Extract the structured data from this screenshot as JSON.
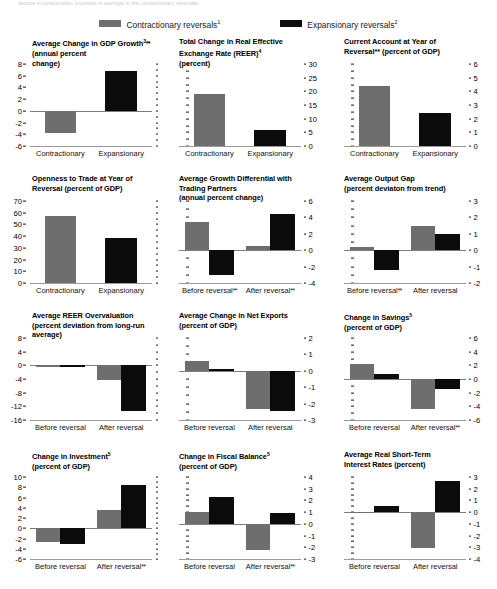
{
  "topnote": "decline in consumption (increase in savings) in the contractionary reversals.",
  "legend": {
    "items": [
      {
        "label": "Contractionary reversals",
        "sup": "1",
        "color": "#6e6e6e",
        "name": "contractionary"
      },
      {
        "label": "Expansionary reversals",
        "sup": "2",
        "color": "#0b0b0b",
        "name": "expansionary"
      }
    ]
  },
  "colors": {
    "gray": "#6e6e6e",
    "black": "#0b0b0b",
    "axis": "#9a9a9a"
  },
  "chart_data": [
    {
      "id": "gdp-growth",
      "type": "bar",
      "title": "Average Change in GDP Growth3** (annual percent change)",
      "title_lines": [
        "Average Change in GDP Growth",
        "(annual percent",
        "change)"
      ],
      "title_sup": "3",
      "title_ast": "**",
      "categories": [
        "Contractionary",
        "Expansionary"
      ],
      "values": [
        -3.8,
        6.8
      ],
      "ylim": [
        -6,
        8
      ],
      "yticks": [
        8,
        6,
        4,
        2,
        0,
        -2,
        -4,
        -6
      ],
      "ylabel_side": "left",
      "ylabel": "",
      "xlabel": "",
      "grid": false,
      "legend_position": "top",
      "mode": "pair"
    },
    {
      "id": "reer-total-change",
      "type": "bar",
      "title": "Total Change in Real Effective Exchange Rate (REER)4 (percent)",
      "title_lines": [
        "Total Change in Real Effective",
        "Exchange Rate (REER)",
        "(percent)"
      ],
      "title_sup": "4",
      "title_ast": "",
      "categories": [
        "Contractionary",
        "Expansionary"
      ],
      "values": [
        19.0,
        5.7
      ],
      "ylim": [
        0,
        30
      ],
      "yticks": [
        30,
        25,
        20,
        15,
        10,
        5,
        0
      ],
      "ylabel_side": "right",
      "ylabel": "",
      "xlabel": "",
      "grid": false,
      "legend_position": "top",
      "mode": "pair"
    },
    {
      "id": "current-account",
      "type": "bar",
      "title": "Current Account at Year of Reversal** (percent of GDP)",
      "title_lines": [
        "Current Account at Year of",
        "Reversal** (percent of GDP)"
      ],
      "title_sup": "",
      "title_ast": "",
      "categories": [
        "Contractionary",
        "Expansionary"
      ],
      "values": [
        4.4,
        2.4
      ],
      "ylim": [
        0,
        6
      ],
      "yticks": [
        6,
        5,
        4,
        3,
        2,
        1,
        0
      ],
      "ylabel_side": "right",
      "ylabel": "",
      "xlabel": "",
      "grid": false,
      "legend_position": "top",
      "mode": "pair"
    },
    {
      "id": "openness-to-trade",
      "type": "bar",
      "title": "Openness to Trade at Year of Reversal (percent of GDP)",
      "title_lines": [
        "Openness to Trade at Year of",
        "Reversal (percent of GDP)"
      ],
      "title_sup": "",
      "title_ast": "",
      "categories": [
        "Contractionary",
        "Expansionary"
      ],
      "values": [
        57.0,
        38.5
      ],
      "ylim": [
        0,
        70
      ],
      "yticks": [
        70,
        60,
        50,
        40,
        30,
        20,
        10,
        0
      ],
      "ylabel_side": "left",
      "ylabel": "",
      "xlabel": "",
      "grid": false,
      "legend_position": "top",
      "mode": "pair"
    },
    {
      "id": "growth-differential",
      "type": "bar",
      "title": "Average Growth Differential with Trading Partners (annual percent change)",
      "title_lines": [
        "Average Growth Differential with",
        "Trading Partners",
        "(annual percent change)"
      ],
      "title_sup": "",
      "title_ast": "",
      "categories": [
        "Before reversal**",
        "After reversal**"
      ],
      "series": [
        {
          "name": "Contractionary reversals",
          "values": [
            3.4,
            0.5
          ]
        },
        {
          "name": "Expansionary reversals",
          "values": [
            -3.0,
            4.4
          ]
        }
      ],
      "ylim": [
        -4,
        6
      ],
      "yticks": [
        6,
        4,
        2,
        0,
        -2,
        -4
      ],
      "ylabel_side": "right",
      "ylabel": "",
      "xlabel": "",
      "grid": false,
      "legend_position": "top",
      "mode": "group"
    },
    {
      "id": "output-gap",
      "type": "bar",
      "title": "Average Output Gap (percent deviaton from trend)",
      "title_lines": [
        "Average Output Gap",
        "(percent deviaton from trend)"
      ],
      "title_sup": "",
      "title_ast": "",
      "categories": [
        "Before reversal**",
        "After reversal"
      ],
      "series": [
        {
          "name": "Contractionary reversals",
          "values": [
            0.2,
            1.5
          ]
        },
        {
          "name": "Expansionary reversals",
          "values": [
            -1.2,
            1.0
          ]
        }
      ],
      "ylim": [
        -2,
        3
      ],
      "yticks": [
        3,
        2,
        1,
        0,
        -1,
        -2
      ],
      "ylabel_side": "right",
      "ylabel": "",
      "xlabel": "",
      "grid": false,
      "legend_position": "top",
      "mode": "group"
    },
    {
      "id": "reer-overvaluation",
      "type": "bar",
      "title": "Average REER Overvaluation (percent deviation from long-run average)",
      "title_lines": [
        "Average REER Overvaluation",
        "(percent deviation from long-run",
        "average)"
      ],
      "title_sup": "",
      "title_ast": "",
      "categories": [
        "Before reversal",
        "After reversal"
      ],
      "series": [
        {
          "name": "Contractionary reversals",
          "values": [
            -0.4,
            -4.3
          ]
        },
        {
          "name": "Expansionary reversals",
          "values": [
            -0.2,
            -13.3
          ]
        }
      ],
      "ylim": [
        -16,
        8
      ],
      "yticks": [
        8,
        4,
        0,
        -4,
        -8,
        -12,
        -16
      ],
      "ylabel_side": "left",
      "ylabel": "",
      "xlabel": "",
      "grid": false,
      "legend_position": "top",
      "mode": "group"
    },
    {
      "id": "net-exports",
      "type": "bar",
      "title": "Average Change in Net Exports (percent of GDP)",
      "title_lines": [
        "Average Change in Net Exports",
        "(percent of GDP)"
      ],
      "title_sup": "",
      "title_ast": "",
      "categories": [
        "Before reversal",
        "After reversal"
      ],
      "series": [
        {
          "name": "Contractionary reversals",
          "values": [
            0.6,
            -2.35
          ]
        },
        {
          "name": "Expansionary reversals",
          "values": [
            0.1,
            -2.45
          ]
        }
      ],
      "ylim": [
        -3,
        2
      ],
      "yticks": [
        2,
        1,
        0,
        -1,
        -2,
        -3
      ],
      "ylabel_side": "right",
      "ylabel": "",
      "xlabel": "",
      "grid": false,
      "legend_position": "top",
      "mode": "group"
    },
    {
      "id": "change-in-savings",
      "type": "bar",
      "title": "Change in Savings5 (percent of GDP)",
      "title_lines": [
        "Change in Savings",
        "(percent of GDP)"
      ],
      "title_sup": "5",
      "title_ast": "",
      "categories": [
        "Before reversal",
        "After reversal**"
      ],
      "series": [
        {
          "name": "Contractionary reversals",
          "values": [
            2.2,
            -4.4
          ]
        },
        {
          "name": "Expansionary reversals",
          "values": [
            0.7,
            -1.4
          ]
        }
      ],
      "ylim": [
        -6,
        6
      ],
      "yticks": [
        6,
        4,
        2,
        0,
        -2,
        -4,
        -6
      ],
      "ylabel_side": "right",
      "ylabel": "",
      "xlabel": "",
      "grid": false,
      "legend_position": "top",
      "mode": "group"
    },
    {
      "id": "change-in-investment",
      "type": "bar",
      "title": "Change in Investment5 (percent of GDP)",
      "title_lines": [
        "Change in Investment",
        "(percent of GDP)"
      ],
      "title_sup": "5",
      "title_ast": "",
      "categories": [
        "Before reversal",
        "After reversal**"
      ],
      "series": [
        {
          "name": "Contractionary reversals",
          "values": [
            -2.6,
            3.5
          ]
        },
        {
          "name": "Expansionary reversals",
          "values": [
            -3.0,
            8.4
          ]
        }
      ],
      "ylim": [
        -6,
        10
      ],
      "yticks": [
        10,
        8,
        6,
        4,
        2,
        0,
        -2,
        -4,
        -6
      ],
      "ylabel_side": "left",
      "ylabel": "",
      "xlabel": "",
      "grid": false,
      "legend_position": "top",
      "mode": "group"
    },
    {
      "id": "fiscal-balance",
      "type": "bar",
      "title": "Change in Fiscal Balance5 (percent of GDP)",
      "title_lines": [
        "Change in Fiscal Balance",
        "(percent of GDP)"
      ],
      "title_sup": "5",
      "title_ast": "",
      "categories": [
        "Before reversal",
        "After reversal**"
      ],
      "series": [
        {
          "name": "Contractionary reversals",
          "values": [
            1.0,
            -2.2
          ]
        },
        {
          "name": "Expansionary reversals",
          "values": [
            2.3,
            0.9
          ]
        }
      ],
      "ylim": [
        -3,
        4
      ],
      "yticks": [
        4,
        3,
        2,
        1,
        0,
        -1,
        -2,
        -3
      ],
      "ylabel_side": "right",
      "ylabel": "",
      "xlabel": "",
      "grid": false,
      "legend_position": "top",
      "mode": "group"
    },
    {
      "id": "real-short-term-rates",
      "type": "bar",
      "title": "Average Real Short-Term Interest Rates (percent)",
      "title_lines": [
        "Average Real Short-Term",
        "Interest Rates (percent)"
      ],
      "title_sup": "",
      "title_ast": "",
      "categories": [
        "Before reversal",
        "After reversal"
      ],
      "series": [
        {
          "name": "Contractionary reversals",
          "values": [
            -0.1,
            -3.1
          ]
        },
        {
          "name": "Expansionary reversals",
          "values": [
            0.55,
            2.7
          ]
        }
      ],
      "ylim": [
        -4,
        3
      ],
      "yticks": [
        3,
        2,
        1,
        0,
        -1,
        -2,
        -3,
        -4
      ],
      "ylabel_side": "right",
      "ylabel": "",
      "xlabel": "",
      "grid": false,
      "legend_position": "top",
      "mode": "group"
    }
  ]
}
